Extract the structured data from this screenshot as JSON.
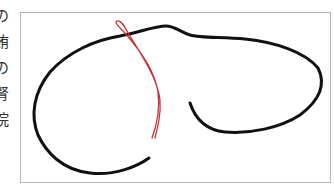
{
  "side_text": {
    "chars": [
      "の",
      "賄",
      "の",
      "腎",
      "院"
    ]
  },
  "figure": {
    "frame_color": "#b5b5b5",
    "line_color": "#111111",
    "loop_color": "#c8323c"
  }
}
